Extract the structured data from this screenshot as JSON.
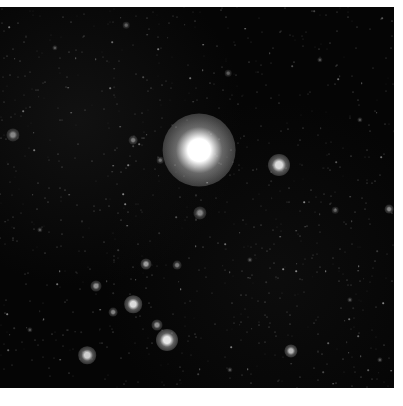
{
  "image": {
    "subject": "astronomical star field",
    "background_color": "#050505",
    "border_color": "#ffffff",
    "field": {
      "x": 0,
      "y": 7,
      "width": 394,
      "height": 381
    }
  },
  "stars": [
    {
      "x": 199,
      "y": 150,
      "r": 14,
      "brightness": 1.0,
      "label": "bright-star"
    },
    {
      "x": 279,
      "y": 165,
      "r": 5,
      "brightness": 0.85
    },
    {
      "x": 133,
      "y": 304,
      "r": 4,
      "brightness": 0.85
    },
    {
      "x": 167,
      "y": 340,
      "r": 5,
      "brightness": 0.9
    },
    {
      "x": 87,
      "y": 355,
      "r": 4,
      "brightness": 0.8
    },
    {
      "x": 146,
      "y": 264,
      "r": 2.5,
      "brightness": 0.6
    },
    {
      "x": 96,
      "y": 286,
      "r": 2.5,
      "brightness": 0.55
    },
    {
      "x": 113,
      "y": 312,
      "r": 2,
      "brightness": 0.5
    },
    {
      "x": 157,
      "y": 325,
      "r": 2.5,
      "brightness": 0.55
    },
    {
      "x": 177,
      "y": 265,
      "r": 2,
      "brightness": 0.45
    },
    {
      "x": 291,
      "y": 351,
      "r": 3,
      "brightness": 0.7
    },
    {
      "x": 389,
      "y": 209,
      "r": 2,
      "brightness": 0.5
    },
    {
      "x": 200,
      "y": 213,
      "r": 3,
      "brightness": 0.5
    },
    {
      "x": 13,
      "y": 135,
      "r": 3,
      "brightness": 0.5
    },
    {
      "x": 133,
      "y": 140,
      "r": 2,
      "brightness": 0.45
    },
    {
      "x": 160,
      "y": 160,
      "r": 1.5,
      "brightness": 0.4
    },
    {
      "x": 228,
      "y": 73,
      "r": 1.5,
      "brightness": 0.35
    },
    {
      "x": 126,
      "y": 25,
      "r": 1.5,
      "brightness": 0.35
    },
    {
      "x": 335,
      "y": 210,
      "r": 1.5,
      "brightness": 0.35
    },
    {
      "x": 55,
      "y": 48,
      "r": 1.2,
      "brightness": 0.3
    },
    {
      "x": 320,
      "y": 60,
      "r": 1.2,
      "brightness": 0.3
    },
    {
      "x": 360,
      "y": 120,
      "r": 1.2,
      "brightness": 0.3
    },
    {
      "x": 250,
      "y": 260,
      "r": 1.2,
      "brightness": 0.3
    },
    {
      "x": 40,
      "y": 230,
      "r": 1.2,
      "brightness": 0.3
    },
    {
      "x": 350,
      "y": 300,
      "r": 1.2,
      "brightness": 0.3
    },
    {
      "x": 230,
      "y": 370,
      "r": 1.2,
      "brightness": 0.3
    },
    {
      "x": 30,
      "y": 330,
      "r": 1.2,
      "brightness": 0.3
    },
    {
      "x": 380,
      "y": 360,
      "r": 1.2,
      "brightness": 0.3
    }
  ],
  "noise": {
    "count": 900,
    "seed": 7,
    "max_alpha": 0.45
  }
}
